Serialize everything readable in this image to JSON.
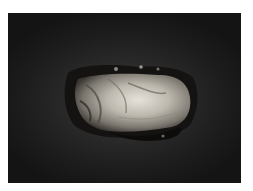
{
  "image": {
    "alt": "Photograph of a pale, irregular oval tissue specimen on a dark gray background",
    "background_color": "#1c1c1c",
    "subject_colors": [
      "#d8d4cc",
      "#a8a49c",
      "#4a4640",
      "#141210"
    ]
  }
}
